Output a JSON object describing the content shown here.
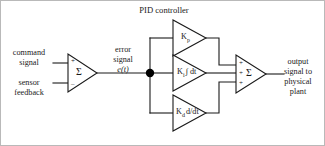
{
  "diagram": {
    "title": "PID controller",
    "type": "control-block-diagram",
    "colors": {
      "line": "#1a1a1a",
      "background": "#ffffff",
      "border": "#b9b9b9",
      "node": "#000000"
    },
    "inputs": {
      "command": {
        "line1": "command",
        "line2": "signal"
      },
      "feedback": {
        "line1": "sensor",
        "line2": "feedback"
      }
    },
    "error": {
      "line1": "error",
      "line2": "signal",
      "line3": "e(t)"
    },
    "summing_junction_left": {
      "symbol": "Σ",
      "sign_top": "+",
      "sign_bottom": "–"
    },
    "summing_junction_right": {
      "symbol": "Σ",
      "sign_top": "+",
      "sign_middle": "+",
      "sign_bottom": "+"
    },
    "blocks": [
      {
        "id": "proportional",
        "gain": "K",
        "subscript": "p",
        "operator": ""
      },
      {
        "id": "integral",
        "gain": "K",
        "subscript": "i",
        "operator": "∫ dt"
      },
      {
        "id": "derivative",
        "gain": "K",
        "subscript": "d",
        "operator": "d/dt"
      }
    ],
    "output": {
      "line1": "output",
      "line2": "signal to",
      "line3": "physical",
      "line4": "plant"
    }
  }
}
